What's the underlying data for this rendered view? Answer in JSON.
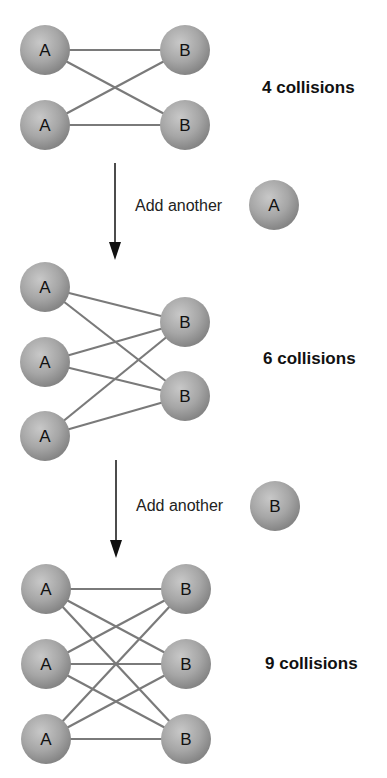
{
  "colors": {
    "ball_light": "#c4c4c4",
    "ball_dark": "#8a8a8a",
    "line": "#7a7a7a",
    "arrow": "#111111",
    "text": "#111111"
  },
  "ball_radius": 25,
  "stages": [
    {
      "collisions_label": "4 collisions",
      "collisions_pos": [
        262,
        93
      ],
      "balls": [
        {
          "label": "A",
          "x": 45,
          "y": 50
        },
        {
          "label": "A",
          "x": 45,
          "y": 125
        },
        {
          "label": "B",
          "x": 185,
          "y": 50
        },
        {
          "label": "B",
          "x": 185,
          "y": 125
        }
      ]
    },
    {
      "collisions_label": "6 collisions",
      "collisions_pos": [
        263,
        364
      ],
      "balls": [
        {
          "label": "A",
          "x": 45,
          "y": 287
        },
        {
          "label": "A",
          "x": 45,
          "y": 362
        },
        {
          "label": "A",
          "x": 45,
          "y": 436
        },
        {
          "label": "B",
          "x": 185,
          "y": 322
        },
        {
          "label": "B",
          "x": 185,
          "y": 396
        }
      ]
    },
    {
      "collisions_label": "9 collisions",
      "collisions_pos": [
        265,
        669
      ],
      "balls": [
        {
          "label": "A",
          "x": 46,
          "y": 589
        },
        {
          "label": "A",
          "x": 46,
          "y": 664
        },
        {
          "label": "A",
          "x": 46,
          "y": 739
        },
        {
          "label": "B",
          "x": 186,
          "y": 589
        },
        {
          "label": "B",
          "x": 186,
          "y": 664
        },
        {
          "label": "B",
          "x": 186,
          "y": 739
        }
      ]
    }
  ],
  "transitions": [
    {
      "text": "Add another",
      "ball_label": "A",
      "arrow_x": 115,
      "arrow_y1": 163,
      "arrow_y2": 260,
      "text_x": 135,
      "text_y": 211,
      "ball_x": 274,
      "ball_y": 205
    },
    {
      "text": "Add another",
      "ball_label": "B",
      "arrow_x": 116,
      "arrow_y1": 460,
      "arrow_y2": 558,
      "text_x": 136,
      "text_y": 511,
      "ball_x": 275,
      "ball_y": 506
    }
  ]
}
